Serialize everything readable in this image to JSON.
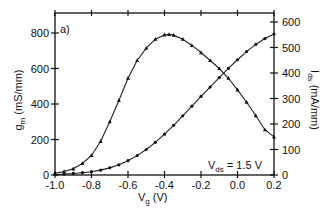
{
  "chart_data": {
    "type": "line",
    "panel_label": "a)",
    "title": "",
    "xlabel": "Vg (V)",
    "xlabel_main": "V",
    "xlabel_sub": "g",
    "xlabel_unit": " (V)",
    "ylabel_left": "gm (mS/mm)",
    "ylabel_left_main": "g",
    "ylabel_left_sub": "m",
    "ylabel_left_unit": " (mS/mm)",
    "ylabel_right": "Ids (mA/mm)",
    "ylabel_right_main": "I",
    "ylabel_right_sub": "ds",
    "ylabel_right_unit": " (mA/mm)",
    "annotation": "Vds = 1.5 V",
    "annotation_main": "V",
    "annotation_sub": "ds",
    "annotation_rest": " = 1.5 V",
    "xlim": [
      -1.0,
      0.2
    ],
    "ylim_left": [
      0,
      900
    ],
    "ylim_right": [
      0,
      650
    ],
    "x_ticks": [
      "-1.0",
      "-0.8",
      "-0.6",
      "-0.4",
      "-0.2",
      "0.0",
      "0.2"
    ],
    "y_left_ticks": [
      "0",
      "200",
      "400",
      "600",
      "800"
    ],
    "y_right_ticks": [
      "0",
      "100",
      "200",
      "300",
      "400",
      "500",
      "600"
    ],
    "grid": false,
    "legend": "none",
    "series": [
      {
        "name": "gm",
        "axis": "left",
        "marker": "triangle",
        "x": [
          -1.0,
          -0.95,
          -0.9,
          -0.85,
          -0.8,
          -0.75,
          -0.7,
          -0.65,
          -0.6,
          -0.55,
          -0.5,
          -0.45,
          -0.4,
          -0.375,
          -0.35,
          -0.3,
          -0.25,
          -0.2,
          -0.15,
          -0.1,
          -0.05,
          0.0,
          0.05,
          0.1,
          0.15,
          0.2
        ],
        "values": [
          10,
          20,
          35,
          65,
          110,
          190,
          300,
          420,
          545,
          645,
          715,
          765,
          790,
          792,
          788,
          765,
          730,
          690,
          645,
          600,
          545,
          480,
          410,
          335,
          255,
          215
        ]
      },
      {
        "name": "Ids",
        "axis": "right",
        "marker": "dot",
        "x": [
          -1.0,
          -0.95,
          -0.9,
          -0.85,
          -0.8,
          -0.75,
          -0.7,
          -0.65,
          -0.6,
          -0.55,
          -0.5,
          -0.45,
          -0.4,
          -0.35,
          -0.3,
          -0.25,
          -0.2,
          -0.15,
          -0.1,
          -0.05,
          0.0,
          0.05,
          0.1,
          0.15,
          0.2
        ],
        "values": [
          2,
          4,
          6,
          9,
          13,
          19,
          28,
          40,
          56,
          76,
          100,
          128,
          160,
          195,
          232,
          270,
          308,
          345,
          382,
          418,
          452,
          484,
          512,
          535,
          553
        ]
      }
    ]
  }
}
